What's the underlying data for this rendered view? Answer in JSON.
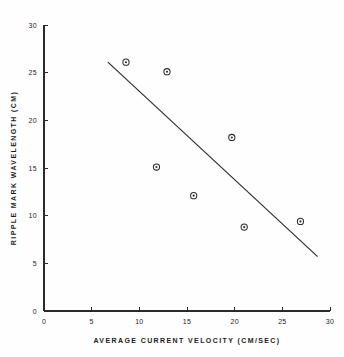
{
  "chart_data": {
    "type": "scatter",
    "title": "",
    "xlabel": "AVERAGE CURRENT VELOCITY  (CM/SEC)",
    "ylabel": "RIPPLE MARK WAVELENGTH  (CM)",
    "xlim": [
      0,
      30
    ],
    "ylim": [
      0,
      30
    ],
    "grid": false,
    "legend": false,
    "xticks": [
      "0",
      "5",
      "10",
      "15",
      "20",
      "25",
      "30"
    ],
    "xtick_values": [
      0,
      5,
      10,
      15,
      20,
      25,
      30
    ],
    "yticks": [
      "0",
      "5",
      "10",
      "15",
      "20",
      "25",
      "30"
    ],
    "ytick_values": [
      0,
      5,
      10,
      15,
      20,
      25,
      30
    ],
    "series": [
      {
        "name": "ripple observations",
        "marker": "open-circle-with-center-dot",
        "color": "#2a2a2a",
        "points": [
          {
            "x": 8.6,
            "y": 26.1
          },
          {
            "x": 12.9,
            "y": 25.1
          },
          {
            "x": 11.8,
            "y": 15.1
          },
          {
            "x": 15.7,
            "y": 12.1
          },
          {
            "x": 19.7,
            "y": 18.2
          },
          {
            "x": 21.0,
            "y": 8.8
          },
          {
            "x": 26.9,
            "y": 9.4
          }
        ]
      }
    ],
    "trend_line": {
      "name": "regression line",
      "color": "#2a2a2a",
      "x_start": 6.7,
      "y_start": 26.1,
      "x_end": 28.7,
      "y_end": 5.7
    }
  }
}
